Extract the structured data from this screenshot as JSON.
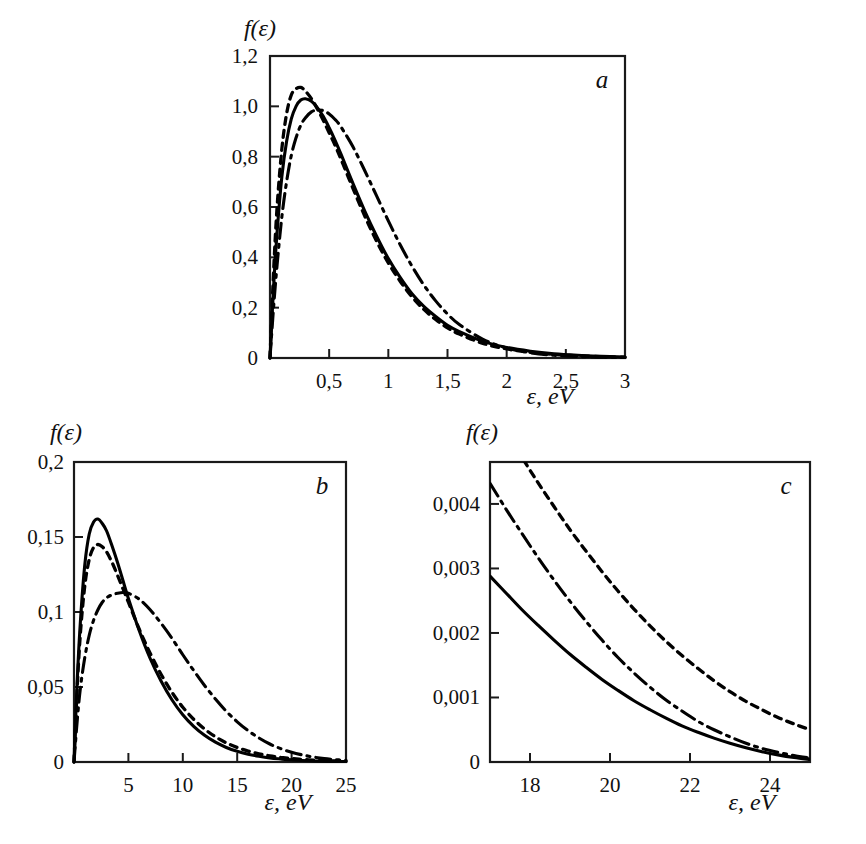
{
  "figure": {
    "background": "#ffffff",
    "ink": "#000000"
  },
  "panels": [
    {
      "id": "a",
      "letter": "a",
      "ylabel": "f(ε)",
      "xlabel": "ε, eV",
      "x_ticks": [
        "0,5",
        "1",
        "1,5",
        "2",
        "2,5",
        "3"
      ],
      "y_ticks": [
        "0",
        "0,2",
        "0,4",
        "0,6",
        "0,8",
        "1,0",
        "1,2"
      ],
      "x_origin_label": "0"
    },
    {
      "id": "b",
      "letter": "b",
      "ylabel": "f(ε)",
      "xlabel": "ε, eV",
      "x_ticks": [
        "5",
        "10",
        "15",
        "20",
        "25"
      ],
      "y_ticks": [
        "0",
        "0,05",
        "0,1",
        "0,15",
        "0,2"
      ],
      "x_origin_label": "0"
    },
    {
      "id": "c",
      "letter": "c",
      "ylabel": "f(ε)",
      "xlabel": "ε, eV",
      "x_ticks": [
        "18",
        "20",
        "22",
        "24"
      ],
      "y_ticks": [
        "0",
        "0,001",
        "0,002",
        "0,003",
        "0,004"
      ],
      "x_origin_label": "0"
    }
  ],
  "chart_data": [
    {
      "type": "line",
      "panel": "a",
      "title": "",
      "xlabel": "ε, eV",
      "ylabel": "f(ε)",
      "xlim": [
        0,
        3
      ],
      "ylim": [
        0,
        1.2
      ],
      "xticks": [
        0,
        0.5,
        1,
        1.5,
        2,
        2.5,
        3
      ],
      "yticks": [
        0,
        0.2,
        0.4,
        0.6,
        0.8,
        1.0,
        1.2
      ],
      "grid": false,
      "legend": "none",
      "series": [
        {
          "name": "solid",
          "style": "solid",
          "x": [
            0,
            0.03,
            0.06,
            0.1,
            0.14,
            0.18,
            0.22,
            0.26,
            0.3,
            0.35,
            0.4,
            0.45,
            0.5,
            0.55,
            0.6,
            0.7,
            0.8,
            0.9,
            1.0,
            1.1,
            1.2,
            1.3,
            1.4,
            1.5,
            1.6,
            1.8,
            2.0,
            2.2,
            2.4,
            2.6,
            2.8,
            3.0
          ],
          "y": [
            0,
            0.28,
            0.5,
            0.72,
            0.86,
            0.95,
            1.0,
            1.025,
            1.03,
            1.02,
            0.995,
            0.96,
            0.915,
            0.865,
            0.81,
            0.695,
            0.585,
            0.485,
            0.395,
            0.32,
            0.255,
            0.205,
            0.165,
            0.13,
            0.105,
            0.066,
            0.042,
            0.027,
            0.017,
            0.011,
            0.007,
            0.004
          ]
        },
        {
          "name": "dashed",
          "style": "dashed",
          "x": [
            0,
            0.03,
            0.06,
            0.1,
            0.14,
            0.18,
            0.22,
            0.26,
            0.3,
            0.35,
            0.4,
            0.45,
            0.5,
            0.55,
            0.6,
            0.7,
            0.8,
            0.9,
            1.0,
            1.1,
            1.2,
            1.3,
            1.4,
            1.5,
            1.6,
            1.8,
            2.0,
            2.2,
            2.4,
            2.6,
            2.8,
            3.0
          ],
          "y": [
            0,
            0.34,
            0.6,
            0.83,
            0.97,
            1.045,
            1.07,
            1.075,
            1.06,
            1.03,
            0.99,
            0.945,
            0.895,
            0.845,
            0.79,
            0.675,
            0.565,
            0.465,
            0.378,
            0.305,
            0.243,
            0.193,
            0.153,
            0.12,
            0.095,
            0.058,
            0.036,
            0.022,
            0.014,
            0.009,
            0.005,
            0.003
          ]
        },
        {
          "name": "dash-dot",
          "style": "dashdot",
          "x": [
            0,
            0.03,
            0.06,
            0.1,
            0.14,
            0.18,
            0.22,
            0.26,
            0.3,
            0.35,
            0.4,
            0.45,
            0.5,
            0.55,
            0.6,
            0.7,
            0.8,
            0.9,
            1.0,
            1.1,
            1.2,
            1.3,
            1.4,
            1.5,
            1.6,
            1.8,
            2.0,
            2.2,
            2.4,
            2.6,
            2.8,
            3.0
          ],
          "y": [
            0,
            0.2,
            0.37,
            0.56,
            0.7,
            0.805,
            0.875,
            0.925,
            0.955,
            0.978,
            0.985,
            0.983,
            0.97,
            0.948,
            0.918,
            0.84,
            0.745,
            0.645,
            0.545,
            0.45,
            0.365,
            0.29,
            0.227,
            0.175,
            0.133,
            0.074,
            0.04,
            0.021,
            0.011,
            0.006,
            0.003,
            0.002
          ]
        }
      ]
    },
    {
      "type": "line",
      "panel": "b",
      "title": "",
      "xlabel": "ε, eV",
      "ylabel": "f(ε)",
      "xlim": [
        0,
        25
      ],
      "ylim": [
        0,
        0.2
      ],
      "xticks": [
        0,
        5,
        10,
        15,
        20,
        25
      ],
      "yticks": [
        0,
        0.05,
        0.1,
        0.15,
        0.2
      ],
      "grid": false,
      "legend": "none",
      "series": [
        {
          "name": "solid",
          "style": "solid",
          "x": [
            0,
            0.3,
            0.6,
            1.0,
            1.4,
            1.8,
            2.2,
            2.6,
            3.0,
            3.5,
            4.0,
            4.5,
            5.0,
            6.0,
            7.0,
            8.0,
            9.0,
            10.0,
            11.0,
            12.0,
            13.0,
            14.0,
            15.0,
            16.0,
            17.0,
            18.0,
            19.0,
            20.0,
            21.0,
            22.0,
            23.0,
            24.0,
            25.0
          ],
          "y": [
            0,
            0.055,
            0.095,
            0.132,
            0.152,
            0.16,
            0.162,
            0.159,
            0.154,
            0.144,
            0.133,
            0.121,
            0.109,
            0.0875,
            0.069,
            0.054,
            0.0415,
            0.0315,
            0.0238,
            0.0178,
            0.0132,
            0.0097,
            0.0071,
            0.0052,
            0.0038,
            0.0027,
            0.002,
            0.0014,
            0.001,
            0.0007,
            0.0005,
            0.0004,
            0.0003
          ]
        },
        {
          "name": "dashed",
          "style": "dashed",
          "x": [
            0,
            0.3,
            0.6,
            1.0,
            1.4,
            1.8,
            2.2,
            2.6,
            3.0,
            3.5,
            4.0,
            4.5,
            5.0,
            6.0,
            7.0,
            8.0,
            9.0,
            10.0,
            11.0,
            12.0,
            13.0,
            14.0,
            15.0,
            16.0,
            17.0,
            18.0,
            19.0,
            20.0,
            21.0,
            22.0,
            23.0,
            24.0,
            25.0
          ],
          "y": [
            0,
            0.05,
            0.087,
            0.118,
            0.135,
            0.143,
            0.145,
            0.1435,
            0.14,
            0.133,
            0.1245,
            0.1155,
            0.1065,
            0.0885,
            0.0725,
            0.0585,
            0.0465,
            0.0365,
            0.0285,
            0.022,
            0.0168,
            0.0128,
            0.0097,
            0.0073,
            0.0055,
            0.0041,
            0.0031,
            0.0023,
            0.0017,
            0.0013,
            0.001,
            0.0007,
            0.00055
          ]
        },
        {
          "name": "dash-dot",
          "style": "dashdot",
          "x": [
            0,
            0.3,
            0.6,
            1.0,
            1.4,
            1.8,
            2.2,
            2.6,
            3.0,
            3.5,
            4.0,
            4.5,
            5.0,
            6.0,
            7.0,
            8.0,
            9.0,
            10.0,
            11.0,
            12.0,
            13.0,
            14.0,
            15.0,
            16.0,
            17.0,
            18.0,
            19.0,
            20.0,
            21.0,
            22.0,
            23.0,
            24.0,
            25.0
          ],
          "y": [
            0,
            0.028,
            0.05,
            0.07,
            0.0845,
            0.0945,
            0.1015,
            0.1065,
            0.1095,
            0.1115,
            0.1125,
            0.113,
            0.1125,
            0.1085,
            0.1015,
            0.0925,
            0.0825,
            0.0715,
            0.061,
            0.051,
            0.042,
            0.0338,
            0.0268,
            0.0209,
            0.016,
            0.012,
            0.0089,
            0.0065,
            0.0047,
            0.0033,
            0.0023,
            0.0016,
            0.0011
          ]
        }
      ]
    },
    {
      "type": "line",
      "panel": "c",
      "title": "",
      "xlabel": "ε, eV",
      "ylabel": "f(ε)",
      "xlim": [
        17,
        25
      ],
      "ylim": [
        0,
        0.00465
      ],
      "xticks": [
        18,
        20,
        22,
        24
      ],
      "yticks": [
        0,
        0.001,
        0.002,
        0.003,
        0.004
      ],
      "grid": false,
      "legend": "none",
      "series": [
        {
          "name": "solid",
          "style": "solid",
          "x": [
            17,
            17.4,
            17.8,
            18.2,
            18.6,
            19.0,
            19.4,
            19.8,
            20.2,
            20.6,
            21.0,
            21.4,
            21.8,
            22.2,
            22.6,
            23.0,
            23.4,
            23.8,
            24.2,
            24.6,
            25.0
          ],
          "y": [
            0.00288,
            0.00262,
            0.00236,
            0.00212,
            0.00189,
            0.00167,
            0.00147,
            0.00128,
            0.00111,
            0.00095,
            0.00081,
            0.00068,
            0.00056,
            0.00046,
            0.00037,
            0.00029,
            0.00022,
            0.00016,
            0.00011,
            7e-05,
            4e-05
          ]
        },
        {
          "name": "dashed",
          "style": "dashed",
          "x": [
            17,
            17.4,
            17.8,
            18.2,
            18.6,
            19.0,
            19.4,
            19.8,
            20.2,
            20.6,
            21.0,
            21.4,
            21.8,
            22.2,
            22.6,
            23.0,
            23.4,
            23.8,
            24.2,
            24.6,
            25.0
          ],
          "y": [
            0.00555,
            0.00513,
            0.00472,
            0.00433,
            0.00396,
            0.0036,
            0.00327,
            0.00295,
            0.00265,
            0.00237,
            0.00211,
            0.00187,
            0.00165,
            0.00145,
            0.00126,
            0.00109,
            0.00094,
            0.00081,
            0.00069,
            0.00059,
            0.0005
          ]
        },
        {
          "name": "dash-dot",
          "style": "dashdot",
          "x": [
            17,
            17.4,
            17.8,
            18.2,
            18.6,
            19.0,
            19.4,
            19.8,
            20.2,
            20.6,
            21.0,
            21.4,
            21.8,
            22.2,
            22.6,
            23.0,
            23.4,
            23.8,
            24.2,
            24.6,
            25.0
          ],
          "y": [
            0.00432,
            0.00392,
            0.00354,
            0.00317,
            0.00282,
            0.00249,
            0.00218,
            0.00189,
            0.00162,
            0.00138,
            0.00116,
            0.00096,
            0.00079,
            0.00063,
            0.0005,
            0.00039,
            0.00029,
            0.00021,
            0.00015,
            0.0001,
            6e-05
          ]
        }
      ]
    }
  ]
}
